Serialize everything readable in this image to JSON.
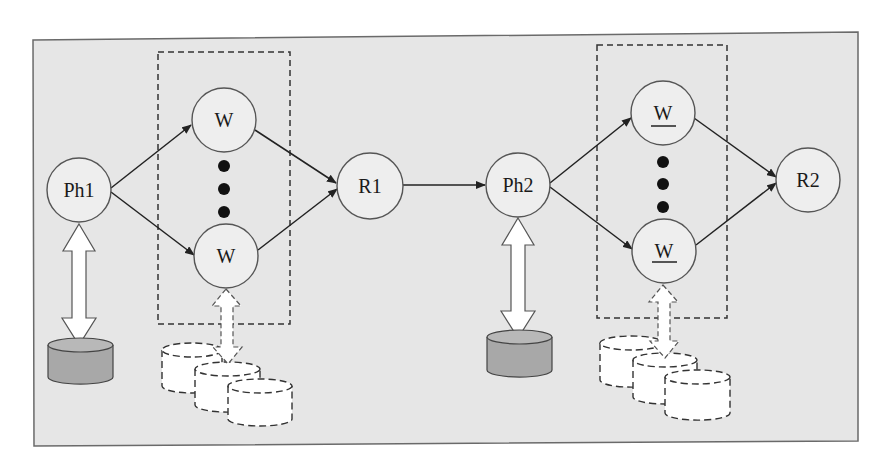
{
  "diagram": {
    "colors": {
      "background": "#e6e6e6",
      "frame_border": "#6a6a6a",
      "node_fill": "#eeeeee",
      "node_stroke": "#555555",
      "edge": "#222222",
      "db_solid_fill": "#a8a8a8",
      "db_dashed_fill": "#ffffff"
    },
    "nodes": [
      {
        "id": "ph1",
        "label": "Ph1",
        "underline": false
      },
      {
        "id": "w1_top",
        "label": "W",
        "underline": false
      },
      {
        "id": "w1_bottom",
        "label": "W",
        "underline": false
      },
      {
        "id": "r1",
        "label": "R1",
        "underline": false
      },
      {
        "id": "ph2",
        "label": "Ph2",
        "underline": false
      },
      {
        "id": "w2_top",
        "label": "W",
        "underline": true
      },
      {
        "id": "w2_bottom",
        "label": "W",
        "underline": true
      },
      {
        "id": "r2",
        "label": "R2",
        "underline": false
      }
    ],
    "edges": [
      {
        "from": "Ph1",
        "to": "W (top)"
      },
      {
        "from": "Ph1",
        "to": "W (bottom)"
      },
      {
        "from": "W (top)",
        "to": "R1"
      },
      {
        "from": "W (bottom)",
        "to": "R1"
      },
      {
        "from": "R1",
        "to": "Ph2"
      },
      {
        "from": "Ph2",
        "to": "W (top, underlined)"
      },
      {
        "from": "Ph2",
        "to": "W (bottom, underlined)"
      },
      {
        "from": "W (top, underlined)",
        "to": "R2"
      },
      {
        "from": "W (bottom, underlined)",
        "to": "R2"
      }
    ],
    "groups": [
      {
        "id": "worker-group-1",
        "style": "dashed",
        "contains": [
          "W",
          "ellipsis",
          "W"
        ]
      },
      {
        "id": "worker-group-2",
        "style": "dashed",
        "contains": [
          "W",
          "ellipsis",
          "W"
        ]
      }
    ],
    "storage": [
      {
        "attached_to": "Ph1",
        "type": "single-solid-database"
      },
      {
        "attached_to": "W (bottom)",
        "type": "three-dashed-databases"
      },
      {
        "attached_to": "Ph2",
        "type": "single-solid-database"
      },
      {
        "attached_to": "W (bottom, underlined)",
        "type": "three-dashed-databases"
      }
    ]
  }
}
